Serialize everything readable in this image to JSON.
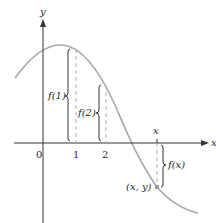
{
  "figure": {
    "type": "function graph with labeled values",
    "axes": {
      "x_label": "x",
      "y_label": "y",
      "origin_label": "0"
    },
    "ticks": [
      {
        "label": "1"
      },
      {
        "label": "2"
      },
      {
        "label": "x"
      }
    ],
    "value_labels": {
      "f1": "f(1)",
      "f2": "f(2)",
      "fx": "f(x)"
    },
    "point_label": "(x, y)",
    "colors": {
      "curve": "#a8a8a8",
      "axes": "#333333",
      "dashed": "#b0b0b0",
      "brace": "#333333"
    }
  }
}
